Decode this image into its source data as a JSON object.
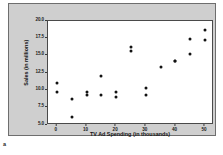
{
  "figure": {
    "label": "a",
    "panel_background": "#cfcfcf",
    "plot_background": "#ffffff",
    "marker_color": "#121212",
    "axis_color": "#4a4a4a"
  },
  "chart_data": {
    "type": "scatter",
    "title": "",
    "xlabel": "TV Ad Spending (in thousands)",
    "ylabel": "Sales (in millions)",
    "xlim": [
      -3,
      53
    ],
    "ylim": [
      5.0,
      20.0
    ],
    "xticks": [
      0,
      10,
      20,
      30,
      40,
      50
    ],
    "xtick_labels": [
      "0",
      "10",
      "20",
      "30",
      "40",
      "50"
    ],
    "yticks": [
      5.0,
      7.5,
      10.0,
      12.5,
      15.0,
      17.5,
      20.0
    ],
    "ytick_labels": [
      "5.0",
      "7.5",
      "10.0",
      "12.5",
      "15.0",
      "17.5",
      "20.0"
    ],
    "grid": false,
    "legend": null,
    "series": [
      {
        "name": "Sales vs TV Ad Spending",
        "x": [
          0,
          0,
          5,
          5,
          10,
          10,
          15,
          15,
          20,
          20,
          25,
          25,
          30,
          30,
          35,
          40,
          40,
          45,
          45,
          50,
          50
        ],
        "y": [
          11.1,
          9.7,
          8.7,
          6.2,
          9.8,
          9.3,
          12.0,
          9.3,
          9.8,
          9.0,
          16.3,
          15.7,
          10.4,
          9.3,
          13.4,
          14.3,
          14.2,
          17.4,
          15.3,
          18.7,
          17.3
        ]
      }
    ]
  }
}
